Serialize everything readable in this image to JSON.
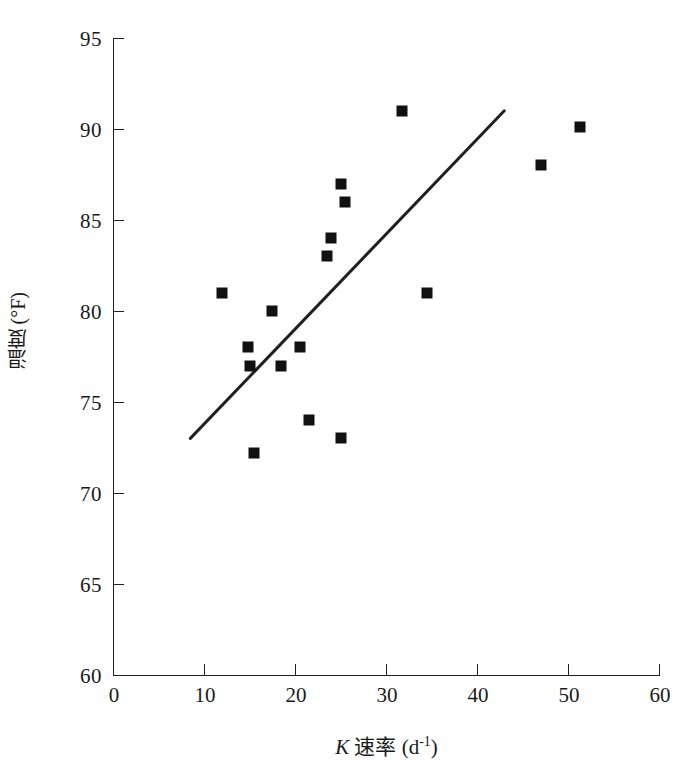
{
  "chart_data": {
    "type": "scatter",
    "title": "",
    "xlabel": "K 速率 (d-1)",
    "ylabel": "温度 (°F)",
    "xlim": [
      0,
      60
    ],
    "ylim": [
      60,
      95
    ],
    "xticks": [
      0,
      10,
      20,
      30,
      40,
      50,
      60
    ],
    "yticks": [
      60,
      65,
      70,
      75,
      80,
      85,
      90,
      95
    ],
    "xtick_labels": [
      "0",
      "10",
      "20",
      "30",
      "40",
      "50",
      "60"
    ],
    "ytick_labels": [
      "60",
      "65",
      "70",
      "75",
      "80",
      "85",
      "90",
      "95"
    ],
    "grid": false,
    "legend": false,
    "marker": "filled-square",
    "marker_color": "#111111",
    "line_color": "#231f20",
    "axis_color": "#231f20",
    "points": [
      {
        "x": 12.0,
        "y": 81.0
      },
      {
        "x": 14.8,
        "y": 78.0
      },
      {
        "x": 15.0,
        "y": 77.0
      },
      {
        "x": 15.5,
        "y": 72.2
      },
      {
        "x": 17.5,
        "y": 80.0
      },
      {
        "x": 18.5,
        "y": 77.0
      },
      {
        "x": 20.5,
        "y": 78.0
      },
      {
        "x": 21.5,
        "y": 74.0
      },
      {
        "x": 23.5,
        "y": 83.0
      },
      {
        "x": 24.0,
        "y": 84.0
      },
      {
        "x": 25.0,
        "y": 73.0
      },
      {
        "x": 25.0,
        "y": 87.0
      },
      {
        "x": 25.5,
        "y": 86.0
      },
      {
        "x": 31.8,
        "y": 91.0
      },
      {
        "x": 34.5,
        "y": 81.0
      },
      {
        "x": 47.0,
        "y": 88.0
      },
      {
        "x": 51.3,
        "y": 90.1
      }
    ],
    "trendline": {
      "x0": 8.5,
      "y0": 73.0,
      "x1": 43.0,
      "y1": 91.0
    }
  },
  "axis_titles": {
    "y": "温度 (°F)",
    "x_symbol": "K",
    "x_text": " 速率 (d",
    "x_exponent": "-1",
    "x_close": ")"
  }
}
